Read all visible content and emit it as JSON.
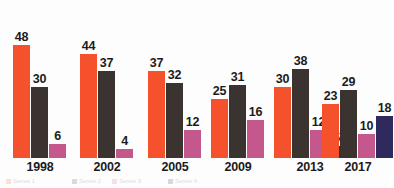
{
  "chart_data": {
    "type": "bar",
    "title": "",
    "subtitle": "",
    "xlabel": "",
    "ylabel": "",
    "ylim": [
      0,
      48
    ],
    "grid": false,
    "legend_position": "bottom",
    "categories": [
      "1998",
      "2002",
      "2005",
      "2009",
      "2013",
      "2017"
    ],
    "series": [
      {
        "name": "Series 1",
        "color": "#f4512c",
        "values": [
          48,
          44,
          37,
          25,
          30,
          23
        ]
      },
      {
        "name": "Series 2",
        "color": "#3b3330",
        "values": [
          30,
          37,
          32,
          31,
          38,
          29
        ]
      },
      {
        "name": "Series 3",
        "color": "#c4588c",
        "values": [
          6,
          4,
          12,
          16,
          12,
          10
        ]
      },
      {
        "name": "Series 4",
        "color": "#2e2a5e",
        "values": [
          null,
          null,
          null,
          null,
          5,
          18
        ]
      }
    ],
    "annotations": "Data labels shown above every bar."
  },
  "colors": {
    "background": "#fdfdfd",
    "label_text": "#1b1b1b",
    "series_1": "#f4512c",
    "series_2": "#3b3330",
    "series_3": "#c4588c",
    "series_4": "#2e2a5e"
  },
  "legend": {
    "entries": [
      {
        "label": "Series 1",
        "color": "#f4512c"
      },
      {
        "label": "Series 2",
        "color": "#3b3330"
      },
      {
        "label": "Series 3",
        "color": "#c4588c"
      },
      {
        "label": "Series 4",
        "color": "#2e2a5e"
      }
    ]
  }
}
